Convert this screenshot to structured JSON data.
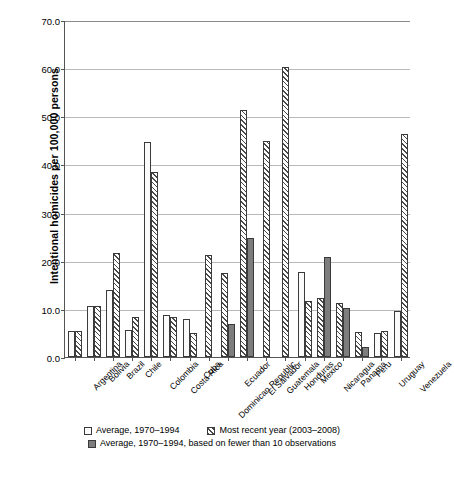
{
  "chart_data": {
    "type": "bar",
    "title": "",
    "xlabel": "",
    "ylabel": "Intentional homicides per 100,000 persons",
    "ylim": [
      0,
      70
    ],
    "ytick_values": [
      0,
      10,
      20,
      30,
      40,
      50,
      60,
      70
    ],
    "ytick_labels": [
      "0.0",
      "10.0",
      "20.0",
      "30.0",
      "40.0",
      "50.0",
      "60.0",
      "70.0"
    ],
    "grid": true,
    "legend_position": "bottom",
    "categories": [
      "Argentina",
      "Bolivia",
      "Brazil",
      "Chile",
      "Colombia",
      "Costa Rica",
      "Cuba",
      "Dominican Republic",
      "Ecuador",
      "El Salvador",
      "Guatemala",
      "Honduras",
      "Mexico",
      "Nicaragua",
      "Panama",
      "Peru",
      "Uruguay",
      "Venezuela"
    ],
    "series": [
      {
        "name": "Average, 1970–1994",
        "pattern": "p-avg",
        "values": [
          5.4,
          10.6,
          14.0,
          5.7,
          44.8,
          8.7,
          8.0,
          null,
          null,
          null,
          null,
          null,
          17.8,
          null,
          null,
          null,
          5.1,
          9.5
        ]
      },
      {
        "name": "Most recent year (2003–2008)",
        "pattern": "p-recent",
        "values": [
          5.4,
          10.6,
          21.7,
          8.3,
          38.6,
          8.3,
          5.0,
          21.2,
          17.6,
          51.5,
          44.9,
          60.5,
          11.6,
          12.2,
          11.2,
          5.2,
          5.5,
          46.5
        ]
      },
      {
        "name": "Average, 1970–1994, based on fewer than 10 observations",
        "pattern": "p-few",
        "values": [
          null,
          null,
          null,
          null,
          null,
          null,
          null,
          null,
          6.8,
          24.8,
          null,
          null,
          null,
          20.9,
          10.3,
          2.0,
          null,
          null
        ]
      }
    ]
  },
  "legend": {
    "items": [
      {
        "label": "Average, 1970–1994",
        "pattern": "p-avg"
      },
      {
        "label": "Most recent year (2003–2008)",
        "pattern": "p-recent"
      },
      {
        "label": "Average, 1970–1994, based on fewer than 10 observations",
        "pattern": "p-few"
      }
    ]
  },
  "caption": ""
}
